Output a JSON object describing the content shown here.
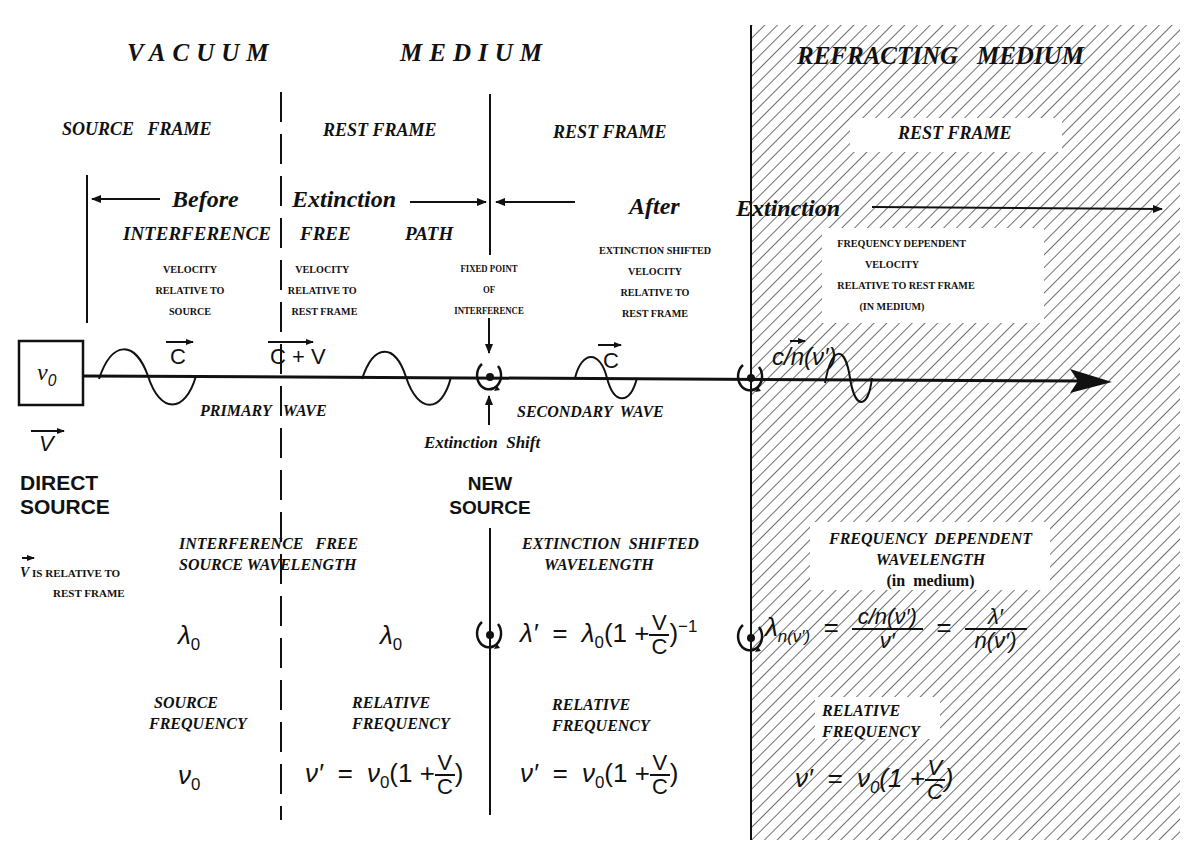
{
  "regions": {
    "vacuum": "VACUUM",
    "medium": "MEDIUM",
    "refracting": "REFRACTING   MEDIUM"
  },
  "frames": {
    "source": "SOURCE   FRAME",
    "rest1": "REST FRAME",
    "rest2": "REST FRAME",
    "rest3": "REST FRAME"
  },
  "arrows": {
    "before": "Before",
    "extinction1": "Extinction",
    "after": "After",
    "extinction2": "Extinction"
  },
  "interference_free_path": {
    "w1": "INTERFERENCE",
    "w2": "FREE",
    "w3": "PATH"
  },
  "captions": {
    "vel_source": [
      "VELOCITY",
      "RELATIVE TO",
      "SOURCE"
    ],
    "vel_rest": [
      "VELOCITY",
      "RELATIVE TO",
      "REST FRAME"
    ],
    "fixed_point": [
      "FIXED POINT",
      "OF",
      "INTERFERENCE"
    ],
    "ext_shifted_vel": [
      "EXTINCTION SHIFTED",
      "VELOCITY",
      "RELATIVE TO",
      "REST FRAME"
    ],
    "freq_dep_vel": [
      "FREQUENCY DEPENDENT",
      "VELOCITY",
      "RELATIVE TO REST FRAME",
      "(IN  MEDIUM)"
    ]
  },
  "beam": {
    "source_symbol": "ν",
    "source_sub": "0",
    "v_vec": "V",
    "c1": "C",
    "cv": "C + V",
    "c2": "C",
    "cn": "c/n(ν′)",
    "primary_wave": "PRIMARY   WAVE",
    "secondary_wave": "SECONDARY  WAVE",
    "extinction_shift": "Extinction  Shift",
    "direct_source": [
      "DIRECT",
      "SOURCE"
    ],
    "new_source": [
      "NEW",
      "SOURCE"
    ],
    "v_note": [
      "IS RELATIVE TO",
      "REST FRAME"
    ]
  },
  "wavelength": {
    "if_label": [
      "INTERFERENCE   FREE",
      "SOURCE WAVELENGTH"
    ],
    "es_label": [
      "EXTINCTION  SHIFTED",
      "WAVELENGTH"
    ],
    "fd_label": [
      "FREQUENCY  DEPENDENT",
      "WAVELENGTH",
      "(in  medium)"
    ],
    "lambda": "λ",
    "sub0": "0",
    "lambda_prime_lhs": "λ′  =  λ",
    "lambda_prime_mid": "(1 +",
    "lambda_prime_exp": "−1",
    "v": "V",
    "c": "C",
    "lambda_n_lhs": "λ",
    "lambda_n_sub": "n(ν′)",
    "lambda_n_num1": "c/n(ν′)",
    "lambda_n_den1": "ν′",
    "lambda_n_num2": "λ′",
    "lambda_n_den2": "n(ν′)",
    "eq": "="
  },
  "frequency": {
    "source_label": [
      "SOURCE",
      "FREQUENCY"
    ],
    "rel_label": [
      "RELATIVE",
      "FREQUENCY"
    ],
    "nu0": "ν",
    "sub0": "0",
    "nu_prime_lhs": "ν′  =  ν",
    "nu_prime_mid": "(1 +",
    "close": ")",
    "v": "V",
    "c": "C"
  }
}
